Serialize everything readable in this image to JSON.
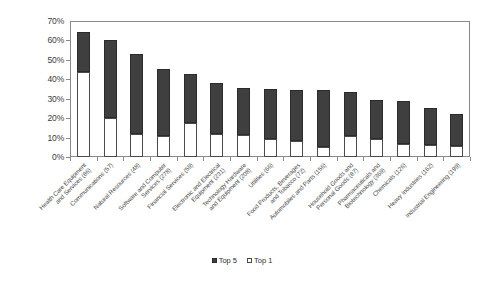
{
  "chart_data": {
    "type": "bar",
    "subtype": "stacked-bar",
    "title": "",
    "xlabel": "",
    "ylabel": "",
    "ylim": [
      0,
      70
    ],
    "ytick_labels": [
      "70%",
      "60%",
      "50%",
      "40%",
      "30%",
      "20%",
      "10%",
      "0%"
    ],
    "ytick_values": [
      70,
      60,
      50,
      40,
      30,
      20,
      10,
      0
    ],
    "grid": false,
    "legend_position": "bottom",
    "categories": [
      "Health Care Equipment and Services (86)",
      "Communications (57)",
      "Natural Resources (48)",
      "Software and Computer Services (278)",
      "Financial Services (59)",
      "Electronic and Electrical Equipment (231)",
      "Technology Hardware and Equipment (208)",
      "Utilities (66)",
      "Food Products, Beverages and Tobacco (72)",
      "Automobiles and Parts (156)",
      "Household Goods and Personal Goods (87)",
      "Pharmaceuticals and Biotechnology (369)",
      "Chemicals (126)",
      "Heavy Industries (162)",
      "Industrial Engineering (199)"
    ],
    "category_lines": [
      [
        "Health Care Equipment",
        "and Services (86)"
      ],
      [
        "Communications (57)"
      ],
      [
        "Natural Resources (48)"
      ],
      [
        "Software and Computer",
        "Services (278)"
      ],
      [
        "Financial Services (59)"
      ],
      [
        "Electronic and Electrical",
        "Equipment (231)"
      ],
      [
        "Technology Hardware",
        "and Equipment (208)"
      ],
      [
        "Utilities (66)"
      ],
      [
        "Food Products, Beverages",
        "and Tobacco (72)"
      ],
      [
        "Automobiles and Parts (156)"
      ],
      [
        "Household Goods and",
        "Personal Goods (87)"
      ],
      [
        "Pharmaceuticals and",
        "Biotechnology (369)"
      ],
      [
        "Chemicals (126)"
      ],
      [
        "Heavy Industries (162)"
      ],
      [
        "Industrial Engineering (199)"
      ]
    ],
    "series": [
      {
        "name": "Top 1",
        "color": "#ffffff",
        "values": [
          44.0,
          20.0,
          12.0,
          11.0,
          17.5,
          12.0,
          11.5,
          9.5,
          8.0,
          5.0,
          11.0,
          9.5,
          6.5,
          6.0,
          5.5
        ]
      },
      {
        "name": "Top 5",
        "color": "#3f3f3f",
        "values": [
          20.5,
          40.0,
          41.0,
          34.5,
          25.0,
          26.0,
          24.0,
          25.5,
          26.5,
          29.5,
          22.5,
          20.0,
          22.5,
          19.0,
          16.5
        ]
      }
    ],
    "totals": [
      64.5,
      60.0,
      53.0,
      45.5,
      42.5,
      38.0,
      35.5,
      35.0,
      34.5,
      34.5,
      33.5,
      29.5,
      29.0,
      25.0,
      22.0
    ]
  },
  "legend": {
    "items": [
      {
        "label": "Top 5",
        "style": "dark"
      },
      {
        "label": "Top 1",
        "style": "light"
      }
    ]
  },
  "axis_color": "#8a8a8a",
  "bar_dark_color": "#3f3f3f",
  "bar_light_color": "#ffffff"
}
